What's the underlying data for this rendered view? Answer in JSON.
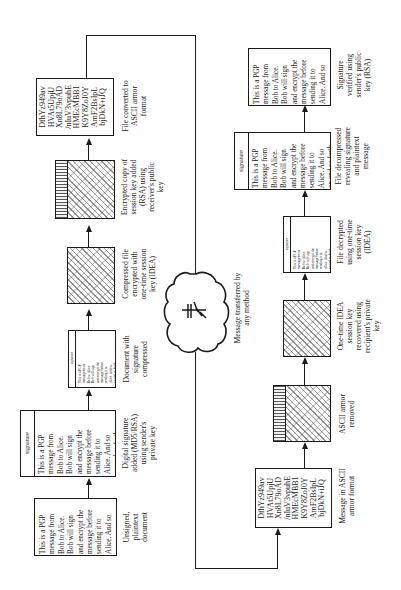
{
  "diagram": {
    "sender_steps": [
      {
        "id": "unsigned",
        "box_type": "plaintext",
        "box_lines": [
          "This is a PGP",
          "message from",
          "Bob to Alice.",
          "Bob will sign",
          "and encrypt the",
          "message before",
          "sending it to",
          "Alice. And so",
          "on and so forth."
        ],
        "label_lines": [
          "Unsigned,",
          "plaintext",
          "document"
        ]
      },
      {
        "id": "digital-signature",
        "box_type": "signed",
        "signature_label": "signature",
        "box_lines": [
          "This is a PGP",
          "message from",
          "Bob to Alice.",
          "Bob will sign",
          "and encrypt the",
          "message before",
          "sending it to",
          "Alice. And so",
          "on and so forth."
        ],
        "label_lines": [
          "Digital signature",
          "added (MD5/RSA)",
          "using sender's",
          "private key"
        ]
      },
      {
        "id": "compressed",
        "box_type": "signed-compressed",
        "signature_label": "signature",
        "box_lines": [
          "This is a PGP",
          "message from",
          "Bob to Alice.",
          "Bob will sign",
          "and encrypt the",
          "message before",
          "sending it to",
          "Alice. And so",
          "on and so forth."
        ],
        "label_lines": [
          "Document with",
          "signature",
          "compressed"
        ]
      },
      {
        "id": "encrypted-idea",
        "box_type": "encrypted",
        "label_lines": [
          "Compressed file",
          "encrypted with",
          "one-time session",
          "key (IDEA)"
        ]
      },
      {
        "id": "session-key-added",
        "box_type": "encrypted-with-key",
        "label_lines": [
          "Encrypted copy of",
          "session key added",
          "(RSA) using",
          "receiver's public",
          "key"
        ]
      },
      {
        "id": "ascii-armor",
        "box_type": "ascii",
        "box_lines": [
          "DfhYz949av",
          "HVAt5UpjU",
          "Xn8L79oAD",
          "/nIuV3vpuhE",
          "HMEcMBB1",
          "K9Y8ZoJ0Y",
          "AmF2BsIpL",
          "bjDkN+iJQ"
        ],
        "label_lines": [
          "File converted to",
          "ASCII armor",
          "format"
        ]
      }
    ],
    "transfer": {
      "label_lines": [
        "Message transferred by",
        "any method"
      ],
      "icon": "lightning-transfer"
    },
    "receiver_steps": [
      {
        "id": "ascii-message",
        "box_type": "ascii",
        "box_lines": [
          "DfhYz949av",
          "HVAt5UpjU",
          "Xn8L79oAD",
          "/nIuV3vpuhE",
          "HMEcMBB1",
          "K9Y8ZoJ0Y",
          "AmF2BsIpL",
          "bjDkN+iJQ"
        ],
        "label_lines": [
          "Message in ASCII",
          "armor format"
        ]
      },
      {
        "id": "armor-removed",
        "box_type": "encrypted-with-key",
        "label_lines": [
          "ASCII armor",
          "removed"
        ]
      },
      {
        "id": "session-key-recovered",
        "box_type": "encrypted",
        "label_lines": [
          "One-time IDEA",
          "session key",
          "recovered using",
          "recipient's private",
          "key"
        ]
      },
      {
        "id": "decrypted",
        "box_type": "signed-compressed",
        "signature_label": "signature",
        "box_lines": [
          "This is a PGP",
          "message from",
          "Bob to Alice.",
          "Bob will sign",
          "and encrypt the",
          "message before",
          "sending it to",
          "Alice. And so",
          "on and so forth."
        ],
        "label_lines": [
          "File decrypted",
          "using one-time",
          "session key",
          "(IDEA)"
        ]
      },
      {
        "id": "decompressed",
        "box_type": "signed",
        "signature_label": "signature",
        "box_lines": [
          "This is a PGP",
          "message from",
          "Bob to Alice.",
          "Bob will sign",
          "and encrypt the",
          "message before",
          "sending it to",
          "Alice. And so",
          "on and so forth."
        ],
        "label_lines": [
          "File decompressed",
          "revealing signature",
          "and plaintext",
          "message"
        ]
      },
      {
        "id": "verified",
        "box_type": "plaintext",
        "box_lines": [
          "This is a PGP",
          "message from",
          "Bob to Alice.",
          "Bob will sign",
          "and encrypt the",
          "message before",
          "sending it to",
          "Alice. And so",
          "on and so forth."
        ],
        "label_lines": [
          "Signature",
          "verified using",
          "sender's public",
          "key (RSA)"
        ]
      }
    ]
  }
}
